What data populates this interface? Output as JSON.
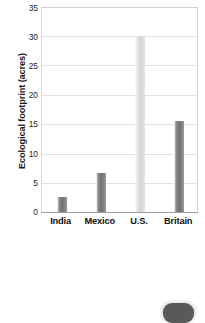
{
  "chart_data": {
    "type": "bar",
    "title": "",
    "xlabel": "",
    "ylabel": "Ecological footprint (acres)",
    "categories": [
      "India",
      "Mexico",
      "U.S.",
      "Britain"
    ],
    "values": [
      2.6,
      6.6,
      30.0,
      15.5
    ],
    "ylim": [
      0,
      35
    ],
    "ytick_labels": [
      "0",
      "5",
      "10",
      "15",
      "20",
      "25",
      "30",
      "35"
    ],
    "ytick_values": [
      0,
      5,
      10,
      15,
      20,
      25,
      30,
      35
    ],
    "grid": "horizontal",
    "legend": "none",
    "bar_colors": [
      "#7d7d7d",
      "#7d7d7d",
      "#dcdcdc",
      "#7d7d7d"
    ],
    "series": [
      {
        "name": "Ecological footprint",
        "values": [
          2.6,
          6.6,
          30.0,
          15.5
        ]
      }
    ]
  },
  "figure": {
    "background_color": "#ffffff",
    "axis_color": "#9e9e9e",
    "grid_color": "#e2e2e2",
    "text_color": "#111111"
  },
  "artifact": {
    "name": "page-corner-mark"
  }
}
